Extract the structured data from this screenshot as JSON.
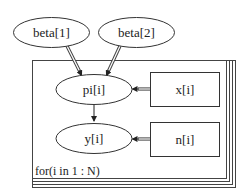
{
  "diagram": {
    "title": "",
    "plate": {
      "label": "for(i in 1 : N)",
      "index": "i",
      "range": "1 : N"
    },
    "nodes": [
      {
        "id": "beta1",
        "label": "beta[1]",
        "shape": "ellipse",
        "kind": "stochastic"
      },
      {
        "id": "beta2",
        "label": "beta[2]",
        "shape": "ellipse",
        "kind": "stochastic"
      },
      {
        "id": "pi",
        "label": "pi[i]",
        "shape": "ellipse",
        "kind": "logical"
      },
      {
        "id": "y",
        "label": "y[i]",
        "shape": "ellipse",
        "kind": "stochastic"
      },
      {
        "id": "x",
        "label": "x[i]",
        "shape": "rectangle",
        "kind": "constant"
      },
      {
        "id": "n",
        "label": "n[i]",
        "shape": "rectangle",
        "kind": "constant"
      }
    ],
    "edges": [
      {
        "from": "beta[1]",
        "to": "pi[i]",
        "style": "double"
      },
      {
        "from": "beta[2]",
        "to": "pi[i]",
        "style": "double"
      },
      {
        "from": "x[i]",
        "to": "pi[i]",
        "style": "double"
      },
      {
        "from": "pi[i]",
        "to": "y[i]",
        "style": "single"
      },
      {
        "from": "n[i]",
        "to": "y[i]",
        "style": "double"
      }
    ]
  }
}
